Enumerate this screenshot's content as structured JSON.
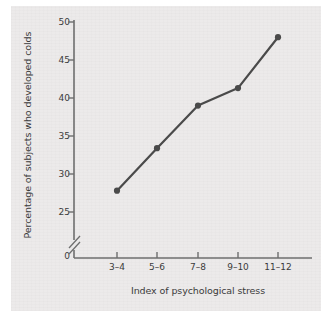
{
  "figure": {
    "background_color": "#ffffff",
    "plate_color": "#eceaea",
    "line_color": "#4a4a4a",
    "axis_color": "#6e6e6e",
    "text_color": "#3b3b3b"
  },
  "chart_data": {
    "type": "line",
    "title": "",
    "subtitle": "",
    "xlabel": "Index of psychological stress",
    "ylabel": "Percentage of subjects who developed colds",
    "categories": [
      "3–4",
      "5–6",
      "7–8",
      "9–10",
      "11–12"
    ],
    "values": [
      27.8,
      33.4,
      39.0,
      41.3,
      48.0
    ],
    "series": [
      {
        "name": "Percentage of subjects who developed colds",
        "values": [
          27.8,
          33.4,
          39.0,
          41.3,
          48.0
        ]
      }
    ],
    "ylim": [
      25,
      50
    ],
    "yticks": [
      25,
      30,
      35,
      40,
      45,
      50
    ],
    "ytick_labels": [
      "25",
      "30",
      "35",
      "40",
      "45",
      "50"
    ],
    "y_origin_label": "0",
    "y_axis_break": true,
    "grid": false,
    "legend": false,
    "legend_position": "none",
    "markers": "filled-circle",
    "annotations": []
  }
}
